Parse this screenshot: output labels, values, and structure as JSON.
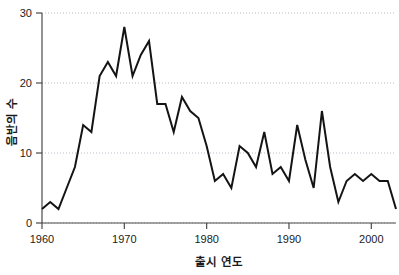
{
  "chart_data": {
    "type": "line",
    "title": "",
    "xlabel": "출시 연도",
    "ylabel": "음반의 수",
    "xlim": [
      1960,
      2003
    ],
    "ylim": [
      0,
      30
    ],
    "xticks": [
      1960,
      1970,
      1980,
      1990,
      2000
    ],
    "xtick_labels": [
      "1960",
      "1970",
      "1980",
      "1990",
      "2000"
    ],
    "yticks": [
      0,
      10,
      20,
      30
    ],
    "ytick_labels": [
      "0",
      "10",
      "20",
      "30"
    ],
    "grid": "horizontal-dotted",
    "legend": "none",
    "line_color": "#141414",
    "series": [
      {
        "name": "음반의 수",
        "x": [
          1960,
          1961,
          1962,
          1963,
          1964,
          1965,
          1966,
          1967,
          1968,
          1969,
          1970,
          1971,
          1972,
          1973,
          1974,
          1975,
          1976,
          1977,
          1978,
          1979,
          1980,
          1981,
          1982,
          1983,
          1984,
          1985,
          1986,
          1987,
          1988,
          1989,
          1990,
          1991,
          1992,
          1993,
          1994,
          1995,
          1996,
          1997,
          1998,
          1999,
          2000,
          2001,
          2002,
          2003
        ],
        "values": [
          2,
          3,
          2,
          5,
          8,
          14,
          13,
          21,
          23,
          21,
          28,
          21,
          24,
          26,
          17,
          17,
          13,
          18,
          16,
          15,
          11,
          6,
          7,
          5,
          11,
          10,
          8,
          13,
          7,
          8,
          6,
          14,
          9,
          5,
          16,
          8,
          3,
          6,
          7,
          6,
          7,
          6,
          6,
          2
        ]
      }
    ]
  },
  "axis": {
    "x_title": "출시 연도",
    "y_title": "음반의 수"
  }
}
